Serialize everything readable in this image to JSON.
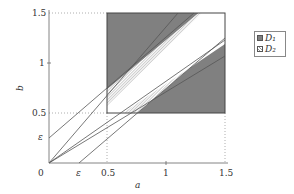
{
  "diagram": {
    "x_axis": {
      "label": "a",
      "ticks": [
        "0",
        "ε",
        "0.5",
        "1",
        "1.5"
      ]
    },
    "y_axis": {
      "label": "b",
      "ticks": [
        "ε",
        "0.5",
        "1",
        "1.5"
      ]
    },
    "epsilon": 0.25,
    "region_square": {
      "a_range": [
        0.5,
        1.5
      ],
      "b_range": [
        0.5,
        1.5
      ]
    },
    "colors": {
      "D1": "#808080",
      "D2_hatch": "#999999",
      "lines": "#555555",
      "axis": "#666666"
    }
  },
  "legend": {
    "items": [
      {
        "label": "D₁",
        "swatch": "solid-gray"
      },
      {
        "label": "D₂",
        "swatch": "hatched"
      }
    ]
  }
}
